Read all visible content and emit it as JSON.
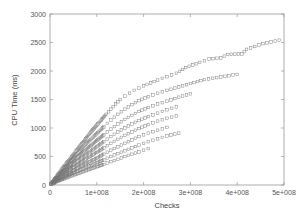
{
  "chart_data": {
    "type": "scatter",
    "title": "",
    "xlabel": "Checks",
    "ylabel": "CPU Time (ms)",
    "xlim": [
      0,
      500000000
    ],
    "ylim": [
      0,
      3000
    ],
    "grid": false,
    "legend": null,
    "x_ticks": [
      {
        "value": 0,
        "label": "0"
      },
      {
        "value": 100000000,
        "label": "1e+008"
      },
      {
        "value": 200000000,
        "label": "2e+008"
      },
      {
        "value": 300000000,
        "label": "3e+008"
      },
      {
        "value": 400000000,
        "label": "4e+008"
      },
      {
        "value": 500000000,
        "label": "5e+008"
      }
    ],
    "y_ticks": [
      {
        "value": 0,
        "label": "0"
      },
      {
        "value": 500,
        "label": "500"
      },
      {
        "value": 1000,
        "label": "1000"
      },
      {
        "value": 1500,
        "label": "1500"
      },
      {
        "value": 2000,
        "label": "2000"
      },
      {
        "value": 2500,
        "label": "2500"
      },
      {
        "value": 3000,
        "label": "3000"
      }
    ],
    "marker": {
      "shape": "open-square",
      "color": "#777777",
      "size": 2.6
    },
    "series": [
      {
        "name": "upper-envelope",
        "points": [
          [
            5000000,
            55
          ],
          [
            10000000,
            110
          ],
          [
            20000000,
            220
          ],
          [
            30000000,
            320
          ],
          [
            40000000,
            430
          ],
          [
            50000000,
            530
          ],
          [
            60000000,
            640
          ],
          [
            70000000,
            740
          ],
          [
            80000000,
            850
          ],
          [
            90000000,
            950
          ],
          [
            100000000,
            1050
          ],
          [
            110000000,
            1140
          ],
          [
            120000000,
            1240
          ],
          [
            130000000,
            1330
          ],
          [
            140000000,
            1420
          ],
          [
            150000000,
            1500
          ],
          [
            160000000,
            1560
          ],
          [
            170000000,
            1610
          ],
          [
            180000000,
            1660
          ],
          [
            190000000,
            1700
          ],
          [
            200000000,
            1740
          ],
          [
            215000000,
            1790
          ],
          [
            230000000,
            1840
          ],
          [
            250000000,
            1900
          ],
          [
            270000000,
            1960
          ],
          [
            290000000,
            2060
          ],
          [
            320000000,
            2150
          ],
          [
            340000000,
            2210
          ],
          [
            365000000,
            2230
          ],
          [
            380000000,
            2290
          ],
          [
            410000000,
            2300
          ],
          [
            420000000,
            2380
          ],
          [
            455000000,
            2480
          ],
          [
            490000000,
            2540
          ]
        ]
      },
      {
        "name": "ray-2",
        "points": [
          [
            20000000,
            190
          ],
          [
            40000000,
            380
          ],
          [
            60000000,
            560
          ],
          [
            80000000,
            740
          ],
          [
            100000000,
            900
          ],
          [
            115000000,
            1020
          ],
          [
            130000000,
            1140
          ],
          [
            145000000,
            1240
          ],
          [
            160000000,
            1330
          ],
          [
            175000000,
            1410
          ],
          [
            190000000,
            1480
          ],
          [
            210000000,
            1550
          ],
          [
            230000000,
            1610
          ],
          [
            250000000,
            1660
          ],
          [
            275000000,
            1720
          ],
          [
            300000000,
            1780
          ],
          [
            330000000,
            1850
          ],
          [
            400000000,
            1940
          ]
        ]
      },
      {
        "name": "ray-3",
        "points": [
          [
            20000000,
            170
          ],
          [
            40000000,
            330
          ],
          [
            60000000,
            490
          ],
          [
            80000000,
            640
          ],
          [
            100000000,
            780
          ],
          [
            115000000,
            880
          ],
          [
            130000000,
            980
          ],
          [
            145000000,
            1070
          ],
          [
            160000000,
            1150
          ],
          [
            175000000,
            1220
          ],
          [
            190000000,
            1290
          ],
          [
            210000000,
            1360
          ],
          [
            230000000,
            1420
          ],
          [
            250000000,
            1470
          ],
          [
            275000000,
            1540
          ],
          [
            300000000,
            1600
          ]
        ]
      },
      {
        "name": "ray-4",
        "points": [
          [
            20000000,
            150
          ],
          [
            40000000,
            290
          ],
          [
            60000000,
            420
          ],
          [
            80000000,
            550
          ],
          [
            100000000,
            670
          ],
          [
            115000000,
            760
          ],
          [
            130000000,
            850
          ],
          [
            145000000,
            930
          ],
          [
            160000000,
            1000
          ],
          [
            175000000,
            1070
          ],
          [
            190000000,
            1130
          ],
          [
            210000000,
            1200
          ],
          [
            230000000,
            1260
          ],
          [
            250000000,
            1320
          ],
          [
            270000000,
            1370
          ]
        ]
      },
      {
        "name": "ray-5",
        "points": [
          [
            20000000,
            130
          ],
          [
            40000000,
            250
          ],
          [
            60000000,
            360
          ],
          [
            80000000,
            470
          ],
          [
            100000000,
            570
          ],
          [
            115000000,
            650
          ],
          [
            130000000,
            730
          ],
          [
            145000000,
            800
          ],
          [
            160000000,
            870
          ],
          [
            175000000,
            930
          ],
          [
            190000000,
            990
          ],
          [
            210000000,
            1060
          ],
          [
            230000000,
            1120
          ],
          [
            250000000,
            1170
          ],
          [
            270000000,
            1210
          ]
        ]
      },
      {
        "name": "ray-6",
        "points": [
          [
            20000000,
            110
          ],
          [
            40000000,
            210
          ],
          [
            60000000,
            300
          ],
          [
            80000000,
            390
          ],
          [
            100000000,
            470
          ],
          [
            115000000,
            540
          ],
          [
            130000000,
            610
          ],
          [
            145000000,
            670
          ],
          [
            160000000,
            730
          ],
          [
            175000000,
            790
          ],
          [
            190000000,
            850
          ],
          [
            210000000,
            910
          ],
          [
            230000000,
            960
          ],
          [
            250000000,
            1010
          ]
        ]
      },
      {
        "name": "ray-7",
        "points": [
          [
            20000000,
            90
          ],
          [
            40000000,
            170
          ],
          [
            60000000,
            250
          ],
          [
            80000000,
            320
          ],
          [
            100000000,
            390
          ],
          [
            115000000,
            440
          ],
          [
            130000000,
            500
          ],
          [
            145000000,
            550
          ],
          [
            160000000,
            600
          ],
          [
            175000000,
            650
          ],
          [
            190000000,
            700
          ],
          [
            210000000,
            760
          ],
          [
            230000000,
            810
          ],
          [
            250000000,
            860
          ],
          [
            275000000,
            910
          ]
        ]
      },
      {
        "name": "ray-8",
        "points": [
          [
            20000000,
            75
          ],
          [
            40000000,
            140
          ],
          [
            60000000,
            200
          ],
          [
            80000000,
            260
          ],
          [
            100000000,
            320
          ],
          [
            115000000,
            360
          ],
          [
            130000000,
            410
          ],
          [
            145000000,
            450
          ],
          [
            160000000,
            500
          ],
          [
            175000000,
            540
          ],
          [
            190000000,
            580
          ],
          [
            210000000,
            640
          ]
        ]
      }
    ]
  }
}
